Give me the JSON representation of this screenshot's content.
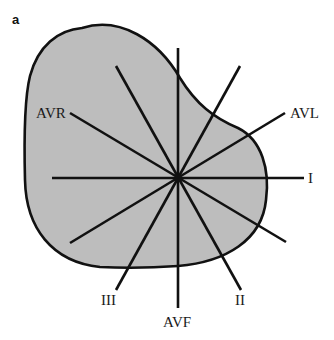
{
  "figure": {
    "panel_label": "a",
    "colors": {
      "shape_fill": "#bdbdbd",
      "stroke": "#111111",
      "background": "#ffffff"
    },
    "center": {
      "x": 178,
      "y": 178
    },
    "leads": [
      {
        "name": "I",
        "label": "I",
        "angle_deg": 0
      },
      {
        "name": "II",
        "label": "II",
        "angle_deg": 60
      },
      {
        "name": "III",
        "label": "III",
        "angle_deg": 120
      },
      {
        "name": "AVR",
        "label": "AVR",
        "angle_deg": -150
      },
      {
        "name": "AVL",
        "label": "AVL",
        "angle_deg": -30
      },
      {
        "name": "AVF",
        "label": "AVF",
        "angle_deg": 90
      }
    ]
  }
}
